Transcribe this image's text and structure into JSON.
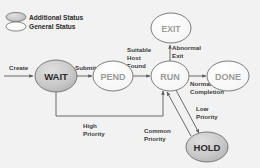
{
  "diagram": {
    "background_color": "#f2f2f2",
    "shaded_fill": "#c9c9c9",
    "plain_fill": "#fbfbfb",
    "stroke_color": "#5a5a5a",
    "legend": {
      "items": [
        {
          "icon": "shaded-ellipse-icon",
          "label": "Additional Status",
          "fill": "#c9c9c9"
        },
        {
          "icon": "plain-ellipse-icon",
          "label": "General Status",
          "fill": "#fbfbfb"
        }
      ]
    },
    "nodes": [
      {
        "id": "wait",
        "label": "WAIT",
        "kind": "additional",
        "cx": 56,
        "cy": 76,
        "rx": 21,
        "ry": 16,
        "font_size": 9.5
      },
      {
        "id": "pend",
        "label": "PEND",
        "kind": "general",
        "cx": 113,
        "cy": 76,
        "rx": 20,
        "ry": 15,
        "font_size": 9
      },
      {
        "id": "run",
        "label": "RUN",
        "kind": "general",
        "cx": 170,
        "cy": 76,
        "rx": 19,
        "ry": 15,
        "font_size": 9
      },
      {
        "id": "done",
        "label": "DONE",
        "kind": "general",
        "cx": 228,
        "cy": 76,
        "rx": 21,
        "ry": 15,
        "font_size": 9
      },
      {
        "id": "exit",
        "label": "EXIT",
        "kind": "general",
        "cx": 171,
        "cy": 28,
        "rx": 20,
        "ry": 15,
        "font_size": 8.5
      },
      {
        "id": "hold",
        "label": "HOLD",
        "kind": "additional",
        "cx": 207,
        "cy": 147,
        "rx": 21,
        "ry": 15,
        "font_size": 9.5
      }
    ],
    "edges": [
      {
        "id": "create",
        "from": "start",
        "to": "wait",
        "label": "Create"
      },
      {
        "id": "submit",
        "from": "wait",
        "to": "pend",
        "label": "Submit"
      },
      {
        "id": "suitable-host",
        "from": "pend",
        "to": "run",
        "label": "Suitable Host Found"
      },
      {
        "id": "normal-completion",
        "from": "run",
        "to": "done",
        "label": "Normal Completion"
      },
      {
        "id": "abnormal-exit",
        "from": "run",
        "to": "exit",
        "label": "Abnormal Exit"
      },
      {
        "id": "high-priority",
        "from": "wait",
        "to": "run",
        "label": "High Priority"
      },
      {
        "id": "low-priority",
        "from": "run",
        "to": "hold",
        "label": "Low Priority"
      },
      {
        "id": "common-priority",
        "from": "hold",
        "to": "run",
        "label": "Common Priority"
      }
    ],
    "edge_labels": {
      "create": "Create",
      "submit": "Submit",
      "suitable_host_1": "Suitable",
      "suitable_host_2": "Host",
      "suitable_host_3": "Found",
      "abnormal_exit_1": "Abnormal",
      "abnormal_exit_2": "Exit",
      "normal_completion_1": "Normal",
      "normal_completion_2": "Completion",
      "high_priority_1": "High",
      "high_priority_2": "Priority",
      "low_priority_1": "Low",
      "low_priority_2": "Priority",
      "common_priority_1": "Common",
      "common_priority_2": "Priority"
    }
  }
}
